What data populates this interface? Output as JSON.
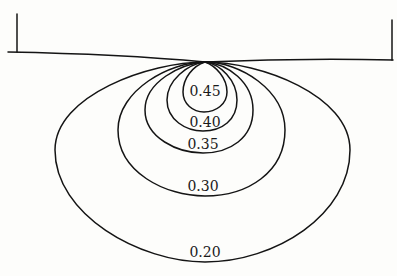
{
  "diagram": {
    "type": "contour-diagram",
    "contours": [
      {
        "label": "0.45",
        "value": 0.45
      },
      {
        "label": "0.40",
        "value": 0.4
      },
      {
        "label": "0.35",
        "value": 0.35
      },
      {
        "label": "0.30",
        "value": 0.3
      },
      {
        "label": "0.20",
        "value": 0.2
      }
    ],
    "colors": {
      "line": "#141414",
      "background": "#fdfdfb"
    }
  }
}
